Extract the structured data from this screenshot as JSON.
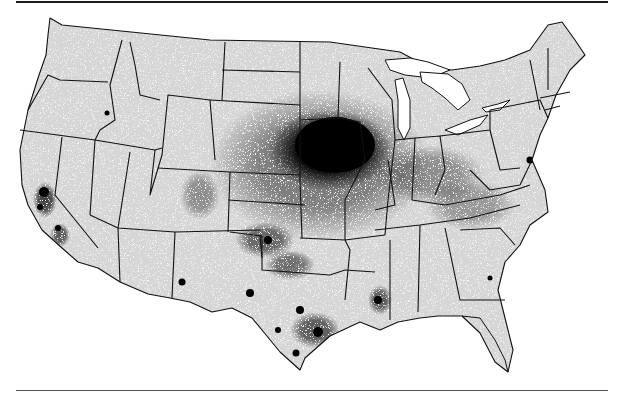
{
  "figure": {
    "type": "dot-density map",
    "region": "Contiguous United States",
    "ink_color": "#000000",
    "background_color": "#ffffff",
    "land_fill": "#f4f4f4",
    "rule_color_top": "#1a1a1a",
    "rule_color_bottom": "#555555"
  },
  "hotspots": [
    {
      "name": "central-plains-core",
      "cx": 330,
      "cy": 150,
      "rx": 70,
      "ry": 45,
      "opacity": 1.0
    },
    {
      "name": "central-plains-halo",
      "cx": 320,
      "cy": 165,
      "rx": 110,
      "ry": 75,
      "opacity": 0.45
    },
    {
      "name": "ohio-valley",
      "cx": 430,
      "cy": 175,
      "rx": 55,
      "ry": 30,
      "opacity": 0.35
    },
    {
      "name": "appalachia",
      "cx": 470,
      "cy": 205,
      "rx": 45,
      "ry": 25,
      "opacity": 0.3
    },
    {
      "name": "oklahoma",
      "cx": 265,
      "cy": 240,
      "rx": 30,
      "ry": 18,
      "opacity": 0.55
    },
    {
      "name": "north-texas",
      "cx": 290,
      "cy": 265,
      "rx": 25,
      "ry": 15,
      "opacity": 0.5
    },
    {
      "name": "texas-gulf",
      "cx": 315,
      "cy": 330,
      "rx": 25,
      "ry": 18,
      "opacity": 0.6
    },
    {
      "name": "south-texas",
      "cx": 295,
      "cy": 350,
      "rx": 12,
      "ry": 10,
      "opacity": 0.6
    },
    {
      "name": "louisiana",
      "cx": 380,
      "cy": 300,
      "rx": 12,
      "ry": 15,
      "opacity": 0.6
    },
    {
      "name": "california-central",
      "cx": 45,
      "cy": 200,
      "rx": 12,
      "ry": 18,
      "opacity": 0.7
    },
    {
      "name": "california-south",
      "cx": 60,
      "cy": 235,
      "rx": 10,
      "ry": 12,
      "opacity": 0.6
    },
    {
      "name": "colorado",
      "cx": 200,
      "cy": 195,
      "rx": 20,
      "ry": 25,
      "opacity": 0.35
    },
    {
      "name": "new-mexico",
      "cx": 180,
      "cy": 275,
      "rx": 8,
      "ry": 8,
      "opacity": 0.55
    },
    {
      "name": "west-texas",
      "cx": 250,
      "cy": 295,
      "rx": 6,
      "ry": 6,
      "opacity": 0.8
    },
    {
      "name": "chesapeake",
      "cx": 528,
      "cy": 160,
      "rx": 10,
      "ry": 10,
      "opacity": 0.5
    },
    {
      "name": "idaho-snake",
      "cx": 107,
      "cy": 113,
      "rx": 4,
      "ry": 6,
      "opacity": 0.7
    }
  ]
}
